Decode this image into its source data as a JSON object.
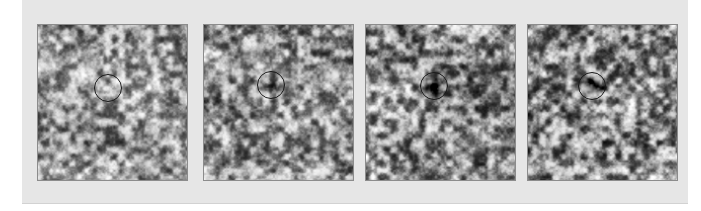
{
  "figure": {
    "title": "",
    "caption": "",
    "background_color": "#e6e6e6",
    "page_color": "#ffffff",
    "panel_border_color": "#8c8c8c",
    "marker_color": "#1a1a1a",
    "panel_count": 4,
    "panel_width_px": 151,
    "panel_height_px": 157
  },
  "chart_data": {
    "type": "heatmap",
    "title": "",
    "subtitle": "",
    "xlabel": "",
    "ylabel": "",
    "colormap": "grayscale",
    "legend_position": "none",
    "grid": false,
    "panels": [
      {
        "index": 1,
        "label": "",
        "marker": {
          "shape": "circle",
          "center_x_px": 108,
          "center_y_px": 88,
          "radius_px": 14,
          "feature": "bright-granule"
        },
        "seed": 11,
        "mean_intensity": 0.58,
        "contrast": 0.42,
        "dark_feature_strength": 0.0,
        "dark_feature_x": 0.47,
        "dark_feature_y": 0.41
      },
      {
        "index": 2,
        "label": "",
        "marker": {
          "shape": "circle",
          "center_x_px": 271,
          "center_y_px": 85,
          "radius_px": 14,
          "feature": "darkening-intergranular-lane"
        },
        "seed": 29,
        "mean_intensity": 0.56,
        "contrast": 0.44,
        "dark_feature_strength": 0.25,
        "dark_feature_x": 0.45,
        "dark_feature_y": 0.39
      },
      {
        "index": 3,
        "label": "",
        "marker": {
          "shape": "circle",
          "center_x_px": 434,
          "center_y_px": 86,
          "radius_px": 14,
          "feature": "dark-pore-forming"
        },
        "seed": 47,
        "mean_intensity": 0.55,
        "contrast": 0.46,
        "dark_feature_strength": 0.62,
        "dark_feature_x": 0.46,
        "dark_feature_y": 0.4
      },
      {
        "index": 4,
        "label": "",
        "marker": {
          "shape": "circle",
          "center_x_px": 592,
          "center_y_px": 86,
          "radius_px": 14,
          "feature": "dark-pore-developed"
        },
        "seed": 67,
        "mean_intensity": 0.54,
        "contrast": 0.48,
        "dark_feature_strength": 0.85,
        "dark_feature_x": 0.44,
        "dark_feature_y": 0.39
      }
    ]
  }
}
